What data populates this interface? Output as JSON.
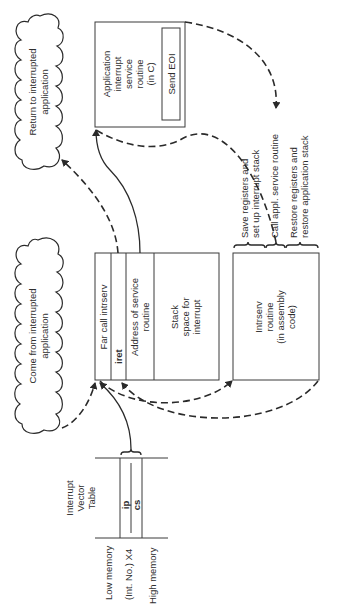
{
  "diagram": {
    "orientation": "rotated-90-ccw",
    "clouds": {
      "return_to_app": [
        "Return to interrupted",
        "application"
      ],
      "come_from_app": [
        "Come from interrupted",
        "application"
      ]
    },
    "app_isr_box": {
      "lines": [
        "Application",
        "interrupt",
        "service",
        "routine",
        "(in C)"
      ],
      "send_eoi": "Send EOI"
    },
    "stack_block": {
      "far_call": "Far call intrserv",
      "iret": "iret",
      "address": [
        "Address of service",
        "routine"
      ],
      "stack_space": [
        "Stack",
        "space for",
        "interrupt"
      ]
    },
    "intrserv_box": {
      "lines": [
        "Intrserv",
        "routine",
        "(in assembly",
        "code)"
      ]
    },
    "intrserv_steps": [
      [
        "Save registers and",
        "set up interrupt stack"
      ],
      [
        "Call appl. service routine"
      ],
      [
        "Restore registers and",
        "restore application stack"
      ]
    ],
    "ivt": {
      "title": [
        "Interrupt",
        "Vector",
        "Table"
      ],
      "ip": "ip",
      "cs": "cs",
      "low_memory": "Low memory",
      "int_no": "(Int. No.) X4",
      "high_memory": "High memory"
    }
  }
}
